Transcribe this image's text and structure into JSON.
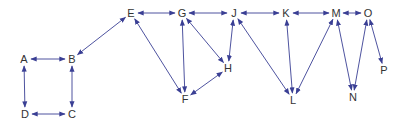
{
  "diagram": {
    "type": "bidirectional-graph",
    "colors": {
      "edge": "#3a3f94",
      "label": "#333333",
      "background": "#ffffff"
    },
    "nodes": [
      {
        "id": "A",
        "label": "A",
        "x": 24,
        "y": 59
      },
      {
        "id": "B",
        "label": "B",
        "x": 72,
        "y": 59
      },
      {
        "id": "C",
        "label": "C",
        "x": 72,
        "y": 114
      },
      {
        "id": "D",
        "label": "D",
        "x": 25,
        "y": 114
      },
      {
        "id": "E",
        "label": "E",
        "x": 131,
        "y": 13
      },
      {
        "id": "G",
        "label": "G",
        "x": 182,
        "y": 13
      },
      {
        "id": "J",
        "label": "J",
        "x": 234,
        "y": 13
      },
      {
        "id": "K",
        "label": "K",
        "x": 286,
        "y": 13
      },
      {
        "id": "M",
        "label": "M",
        "x": 336,
        "y": 13
      },
      {
        "id": "O",
        "label": "O",
        "x": 368,
        "y": 13
      },
      {
        "id": "H",
        "label": "H",
        "x": 228,
        "y": 68
      },
      {
        "id": "F",
        "label": "F",
        "x": 185,
        "y": 99
      },
      {
        "id": "L",
        "label": "L",
        "x": 293,
        "y": 100
      },
      {
        "id": "N",
        "label": "N",
        "x": 353,
        "y": 97
      },
      {
        "id": "P",
        "label": "P",
        "x": 384,
        "y": 70
      }
    ],
    "edges": [
      {
        "from": "A",
        "to": "B",
        "bidirectional": true
      },
      {
        "from": "A",
        "to": "D",
        "bidirectional": true
      },
      {
        "from": "B",
        "to": "C",
        "bidirectional": true
      },
      {
        "from": "D",
        "to": "C",
        "bidirectional": true
      },
      {
        "from": "B",
        "to": "E",
        "bidirectional": true
      },
      {
        "from": "E",
        "to": "G",
        "bidirectional": true
      },
      {
        "from": "G",
        "to": "J",
        "bidirectional": true
      },
      {
        "from": "J",
        "to": "K",
        "bidirectional": true
      },
      {
        "from": "K",
        "to": "M",
        "bidirectional": true
      },
      {
        "from": "M",
        "to": "O",
        "bidirectional": true
      },
      {
        "from": "E",
        "to": "F",
        "bidirectional": true
      },
      {
        "from": "G",
        "to": "F",
        "bidirectional": true
      },
      {
        "from": "G",
        "to": "H",
        "bidirectional": true
      },
      {
        "from": "F",
        "to": "H",
        "bidirectional": true
      },
      {
        "from": "J",
        "to": "H",
        "bidirectional": true
      },
      {
        "from": "J",
        "to": "L",
        "bidirectional": true
      },
      {
        "from": "K",
        "to": "L",
        "bidirectional": true
      },
      {
        "from": "M",
        "to": "L",
        "bidirectional": true
      },
      {
        "from": "M",
        "to": "N",
        "bidirectional": true
      },
      {
        "from": "O",
        "to": "N",
        "bidirectional": true
      },
      {
        "from": "O",
        "to": "P",
        "bidirectional": true
      }
    ]
  }
}
